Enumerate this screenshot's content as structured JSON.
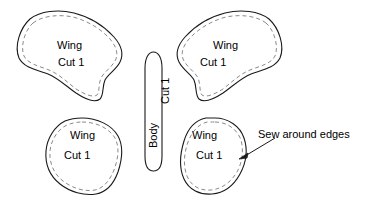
{
  "diagram": {
    "stroke_color": "#1a1a1a",
    "dash_color": "#8a8a8a",
    "background_color": "#ffffff",
    "pieces": [
      {
        "id": "wing-top-left",
        "name_line1": "Wing",
        "name_line2": "Cut 1",
        "orientation": "horizontal",
        "position": "top-left"
      },
      {
        "id": "wing-top-right",
        "name_line1": "Wing",
        "name_line2": "Cut 1",
        "orientation": "horizontal",
        "position": "top-right"
      },
      {
        "id": "body-center",
        "name_line1": "Body",
        "name_line2": "Cut 1",
        "orientation": "vertical-rotated",
        "position": "center"
      },
      {
        "id": "wing-bottom-left",
        "name_line1": "Wing",
        "name_line2": "Cut 1",
        "orientation": "horizontal",
        "position": "bottom-left"
      },
      {
        "id": "wing-bottom-right",
        "name_line1": "Wing",
        "name_line2": "Cut 1",
        "orientation": "horizontal",
        "position": "bottom-right"
      }
    ],
    "annotations": [
      {
        "id": "sew-around-edges",
        "text": "Sew around edges",
        "points_to": "wing-bottom-right-edge"
      }
    ]
  }
}
